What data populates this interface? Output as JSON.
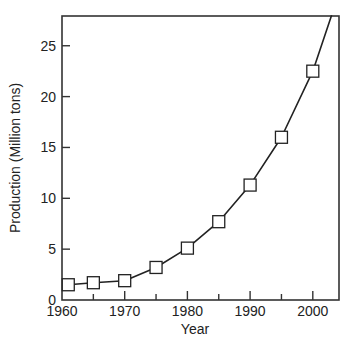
{
  "chart_data": {
    "type": "line",
    "title": "",
    "xlabel": "Year",
    "ylabel": "Production (Million tons)",
    "xlim": [
      1960,
      2004
    ],
    "ylim": [
      0,
      28
    ],
    "x_ticks": [
      1960,
      1970,
      1980,
      1990,
      2000
    ],
    "x_minor_ticks": [
      1965,
      1975,
      1985,
      1995
    ],
    "y_ticks": [
      0,
      5,
      10,
      15,
      20,
      25
    ],
    "grid": false,
    "legend": null,
    "marker": "open-square",
    "series": [
      {
        "name": "Production",
        "x": [
          1961,
          1965,
          1970,
          1975,
          1980,
          1985,
          1990,
          1995,
          2000
        ],
        "values": [
          1.5,
          1.7,
          1.9,
          3.2,
          5.1,
          7.7,
          11.3,
          16.0,
          22.5
        ],
        "extends_to": {
          "x": 2003,
          "y": 28
        }
      }
    ]
  },
  "colors": {
    "line": "#222222",
    "axis": "#333333",
    "marker_fill": "#ffffff"
  }
}
